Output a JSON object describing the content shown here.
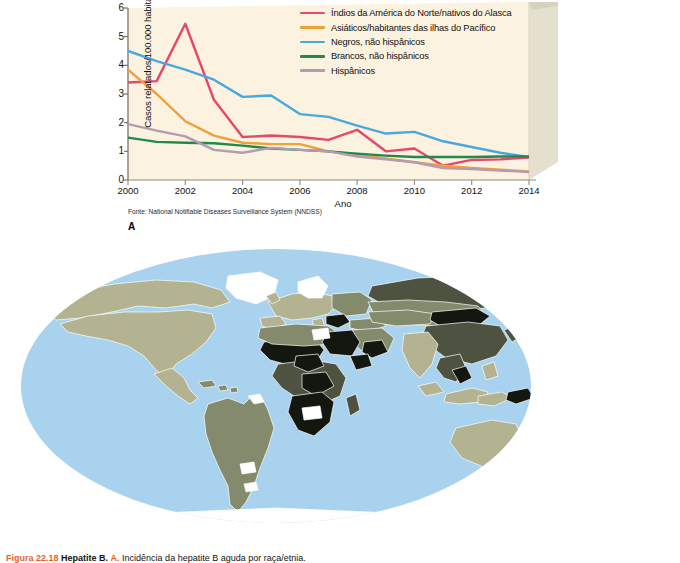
{
  "panel_a": {
    "letter": "A",
    "source_note": "Fonte: National Notifiable Diseases Surveillance System (NNDSS)",
    "chart_data": {
      "type": "line",
      "title": "",
      "xlabel": "Ano",
      "ylabel": "Casos relatados/100.000 habitantes",
      "xlim": [
        2000,
        2014
      ],
      "ylim": [
        0,
        6
      ],
      "xticks": [
        "2000",
        "2002",
        "2004",
        "2006",
        "2008",
        "2010",
        "2012",
        "2014"
      ],
      "yticks": [
        "0",
        "1",
        "2",
        "3",
        "4",
        "5",
        "6"
      ],
      "grid": false,
      "legend_position": "top-right-inside",
      "x": [
        2000,
        2001,
        2002,
        2003,
        2004,
        2005,
        2006,
        2007,
        2008,
        2009,
        2010,
        2011,
        2012,
        2013,
        2014
      ],
      "series": [
        {
          "name": "Índios da América do Norte/nativos do Alasca",
          "color": "#e8476b",
          "values": [
            3.4,
            3.45,
            5.45,
            2.8,
            1.5,
            1.55,
            1.5,
            1.4,
            1.75,
            1.0,
            1.1,
            0.5,
            0.7,
            0.72,
            0.78
          ]
        },
        {
          "name": "Asiáticos/habitantes das ilhas do Pacífico",
          "color": "#eda13c",
          "values": [
            3.85,
            3.0,
            2.05,
            1.55,
            1.3,
            1.25,
            1.25,
            1.0,
            0.88,
            0.75,
            0.62,
            0.5,
            0.42,
            0.36,
            0.3
          ]
        },
        {
          "name": "Negros, não hispânicos",
          "color": "#49a9dd",
          "values": [
            4.5,
            4.15,
            3.85,
            3.5,
            2.9,
            2.95,
            2.3,
            2.2,
            1.9,
            1.62,
            1.68,
            1.35,
            1.15,
            0.95,
            0.8
          ]
        },
        {
          "name": "Brancos, não hispânicos",
          "color": "#1f8a4c",
          "values": [
            1.48,
            1.33,
            1.3,
            1.28,
            1.2,
            1.1,
            1.05,
            1.0,
            0.92,
            0.85,
            0.8,
            0.8,
            0.8,
            0.82,
            0.82
          ]
        },
        {
          "name": "Hispânicos",
          "color": "#b49ab2",
          "values": [
            1.95,
            1.72,
            1.52,
            1.05,
            0.95,
            1.12,
            1.05,
            1.0,
            0.82,
            0.72,
            0.62,
            0.42,
            0.38,
            0.33,
            0.28
          ]
        }
      ]
    }
  },
  "panel_b": {
    "letter": "B",
    "legend": {
      "title": "Prevalência da hepatite B",
      "items": [
        {
          "label": "Alta: ≥ 8%",
          "color": "#14170f"
        },
        {
          "label": "Intermediária alta: 5 a 7%",
          "color": "#4d5241"
        },
        {
          "label": "Intermediária baixa: 2 a 4%",
          "color": "#838b6c"
        },
        {
          "label": "Baixa: < 2%",
          "color": "#b3b291"
        },
        {
          "label": "Nenhum dado",
          "color": "#ffffff"
        }
      ]
    },
    "map": {
      "ocean_color": "#a8d2ee",
      "border_color": "#ffffff"
    }
  },
  "figure_caption": {
    "number": "Figura 22.18",
    "title": "Hepatite B.",
    "panel_ref": "A.",
    "body": "Incidência da hepatite B aguda por raça/etnia."
  }
}
